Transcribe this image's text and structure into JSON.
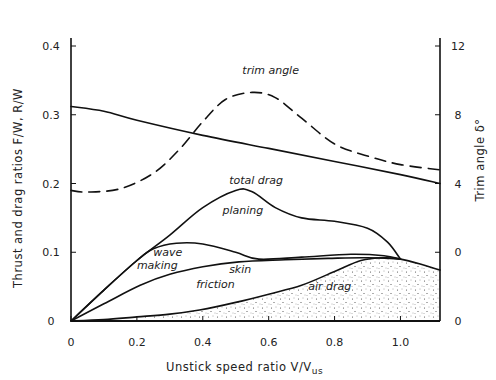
{
  "chart_data": {
    "type": "line",
    "title": "",
    "xlabel": "Unstick speed ratio V/V_us",
    "ylabel": "Thrust and drag ratios F/W, R/W",
    "y2label": "Trim angle δ°",
    "xlim": [
      0,
      1.12
    ],
    "ylim": [
      0,
      0.4
    ],
    "y2lim": [
      -4,
      12
    ],
    "grid": false,
    "x_ticks": [
      "0",
      "0.2",
      "0.4",
      "0.6",
      "0.8",
      "1.0"
    ],
    "x_tick_values": [
      0,
      0.2,
      0.4,
      0.6,
      0.8,
      1.0
    ],
    "y_ticks": [
      "0",
      "0.1",
      "0.2",
      "0.3",
      "0.4"
    ],
    "y_tick_values": [
      0,
      0.1,
      0.2,
      0.3,
      0.4
    ],
    "y2_ticks": [
      "0",
      "0",
      "4",
      "8",
      "12"
    ],
    "y2_tick_values": [
      -4,
      0,
      4,
      8,
      12
    ],
    "series": [
      {
        "name": "thrust",
        "axis": "left",
        "style": "solid",
        "x": [
          0,
          0.1,
          0.2,
          0.4,
          0.6,
          0.8,
          1.0,
          1.12
        ],
        "y": [
          0.312,
          0.305,
          0.292,
          0.27,
          0.251,
          0.232,
          0.213,
          0.2
        ]
      },
      {
        "name": "trim angle",
        "axis": "right",
        "style": "dashed",
        "x": [
          0,
          0.05,
          0.15,
          0.25,
          0.33,
          0.4,
          0.47,
          0.55,
          0.62,
          0.7,
          0.8,
          0.9,
          1.0,
          1.12
        ],
        "y": [
          3.6,
          3.5,
          3.7,
          4.6,
          6.0,
          7.6,
          8.9,
          9.3,
          9.0,
          7.8,
          6.3,
          5.6,
          5.1,
          4.8
        ]
      },
      {
        "name": "total drag",
        "axis": "left",
        "style": "solid",
        "x": [
          0,
          0.1,
          0.2,
          0.3,
          0.4,
          0.5,
          0.55,
          0.62,
          0.7,
          0.8,
          0.9,
          0.96,
          1.0
        ],
        "y": [
          0,
          0.045,
          0.088,
          0.125,
          0.165,
          0.19,
          0.188,
          0.165,
          0.15,
          0.145,
          0.135,
          0.115,
          0.09
        ]
      },
      {
        "name": "wave making",
        "axis": "left",
        "style": "solid",
        "x": [
          0,
          0.1,
          0.2,
          0.25,
          0.32,
          0.4,
          0.5,
          0.57,
          0.7,
          0.85,
          0.95,
          1.0
        ],
        "y": [
          0,
          0.045,
          0.088,
          0.105,
          0.113,
          0.112,
          0.1,
          0.09,
          0.093,
          0.097,
          0.095,
          0.09
        ]
      },
      {
        "name": "skin friction",
        "axis": "left",
        "style": "solid",
        "x": [
          0,
          0.1,
          0.21,
          0.3,
          0.4,
          0.51,
          0.65,
          0.78,
          0.9,
          1.0
        ],
        "y": [
          0,
          0.025,
          0.052,
          0.068,
          0.079,
          0.086,
          0.089,
          0.091,
          0.092,
          0.09
        ]
      },
      {
        "name": "air drag",
        "axis": "left",
        "style": "solid-stippled-fill",
        "x": [
          0,
          0.1,
          0.2,
          0.3,
          0.39,
          0.5,
          0.6,
          0.7,
          0.8,
          0.88,
          0.95,
          1.0,
          1.06,
          1.12
        ],
        "y": [
          0,
          0.002,
          0.006,
          0.01,
          0.016,
          0.027,
          0.039,
          0.052,
          0.072,
          0.088,
          0.092,
          0.09,
          0.083,
          0.074
        ]
      }
    ],
    "annotations": [
      {
        "text": "trim angle",
        "x": 0.52,
        "y": 0.36
      },
      {
        "text": "total drag",
        "x": 0.48,
        "y": 0.2
      },
      {
        "text": "planing",
        "x": 0.46,
        "y": 0.155
      },
      {
        "text": "wave",
        "x": 0.25,
        "y": 0.095
      },
      {
        "text": "making",
        "x": 0.2,
        "y": 0.075
      },
      {
        "text": "skin",
        "x": 0.48,
        "y": 0.07
      },
      {
        "text": "friction",
        "x": 0.38,
        "y": 0.048
      },
      {
        "text": "air drag",
        "x": 0.72,
        "y": 0.045
      }
    ]
  },
  "labels": {
    "xlabel_main": "Unstick speed ratio  V/V",
    "xlabel_sub": "us",
    "ylabel": "Thrust and drag ratios  F/W, R/W",
    "y2label": "Trim angle  δ°"
  }
}
